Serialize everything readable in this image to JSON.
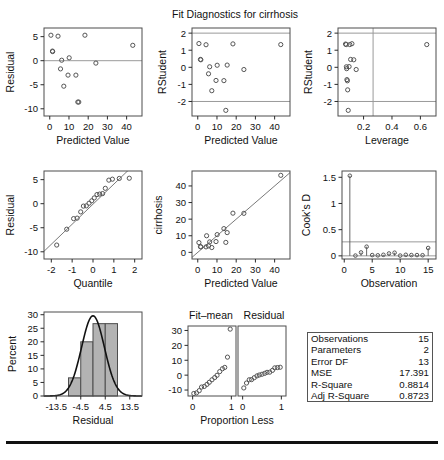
{
  "figure": {
    "title": "Fit Diagnostics for cirrhosis",
    "subtitle_fitmean": "Fit–mean",
    "subtitle_residual": "Residual"
  },
  "stats_table": {
    "rows": [
      {
        "label": "Observations",
        "value": "15"
      },
      {
        "label": "Parameters",
        "value": "2"
      },
      {
        "label": "Error DF",
        "value": "13"
      },
      {
        "label": "MSE",
        "value": "17.391"
      },
      {
        "label": "R-Square",
        "value": "0.8814"
      },
      {
        "label": "Adj R-Square",
        "value": "0.8723"
      }
    ]
  },
  "chart_data": [
    {
      "id": "residual-vs-predicted",
      "type": "scatter",
      "title": "",
      "xlabel": "Predicted Value",
      "ylabel": "Residual",
      "xlim": [
        -3,
        48
      ],
      "ylim": [
        -11.5,
        6.8
      ],
      "xticks": [
        0,
        10,
        20,
        30,
        40
      ],
      "yticks": [
        -10,
        -5,
        0,
        5
      ],
      "reflines_y": [
        0
      ],
      "grid": false,
      "x": [
        0.6,
        1.4,
        1.5,
        4.3,
        5.6,
        6.2,
        7.3,
        9.5,
        10.1,
        13.6,
        14.6,
        15.1,
        18.3,
        24.0,
        43.2
      ],
      "y": [
        5.3,
        2.0,
        1.9,
        5.1,
        -1.7,
        0.1,
        -5.3,
        -3.0,
        0.6,
        -3.0,
        -8.6,
        -8.6,
        5.3,
        -0.5,
        3.2
      ]
    },
    {
      "id": "rstudent-vs-predicted",
      "type": "scatter",
      "title": "",
      "xlabel": "Predicted Value",
      "ylabel": "RStudent",
      "xlim": [
        -3,
        48
      ],
      "ylim": [
        -2.85,
        2.3
      ],
      "xticks": [
        0,
        10,
        20,
        30,
        40
      ],
      "yticks": [
        -2,
        -1,
        0,
        1,
        2
      ],
      "reflines_y": [
        -2,
        2
      ],
      "grid": false,
      "x": [
        0.6,
        1.4,
        1.6,
        4.3,
        5.6,
        6.2,
        7.3,
        9.5,
        10.1,
        13.6,
        14.6,
        15.3,
        18.3,
        24.0,
        43.2
      ],
      "y": [
        1.39,
        0.46,
        0.44,
        1.32,
        -0.38,
        0.03,
        -1.37,
        -0.77,
        0.12,
        -0.78,
        -2.52,
        0.13,
        1.37,
        -0.13,
        1.33
      ]
    },
    {
      "id": "rstudent-vs-leverage",
      "type": "scatter",
      "title": "",
      "xlabel": "Leverage",
      "ylabel": "RStudent",
      "xlim": [
        0.02,
        0.71
      ],
      "ylim": [
        -2.85,
        2.3
      ],
      "xticks": [
        0.2,
        0.4,
        0.6
      ],
      "yticks": [
        -2,
        -1,
        0,
        1,
        2
      ],
      "reflines_y": [
        -2,
        2
      ],
      "reflines_x": [
        0.267
      ],
      "grid": false,
      "x": [
        0.073,
        0.078,
        0.079,
        0.081,
        0.083,
        0.086,
        0.088,
        0.092,
        0.098,
        0.103,
        0.109,
        0.118,
        0.131,
        0.148,
        0.645
      ],
      "y": [
        1.36,
        1.33,
        0.03,
        -0.08,
        -0.72,
        -0.79,
        -1.32,
        -2.52,
        0.04,
        1.33,
        0.46,
        1.38,
        0.44,
        -0.13,
        1.33
      ]
    },
    {
      "id": "qq-plot",
      "type": "scatter",
      "title": "",
      "xlabel": "Quantile",
      "ylabel": "Residual",
      "xlim": [
        -2.35,
        2.35
      ],
      "ylim": [
        -11.5,
        6.8
      ],
      "xticks": [
        -2,
        -1,
        0,
        1,
        2
      ],
      "yticks": [
        -10,
        -5,
        0,
        5
      ],
      "fitline": {
        "slope": 4.17,
        "intercept": -0.1
      },
      "grid": false,
      "x": [
        -1.74,
        -1.26,
        -0.93,
        -0.76,
        -0.59,
        -0.46,
        -0.32,
        -0.19,
        -0.06,
        0.06,
        0.19,
        0.32,
        0.46,
        0.59,
        0.76,
        0.93,
        1.26,
        1.74
      ],
      "y": [
        -8.6,
        -5.3,
        -3.1,
        -3.0,
        -1.7,
        -0.5,
        -0.45,
        0.1,
        0.6,
        1.2,
        1.9,
        2.0,
        2.1,
        3.2,
        4.9,
        5.1,
        5.25,
        5.3
      ]
    },
    {
      "id": "observed-vs-predicted",
      "type": "scatter",
      "title": "",
      "xlabel": "Predicted Value",
      "ylabel": "cirrhosis",
      "xlim": [
        -3,
        48
      ],
      "ylim": [
        -4,
        49
      ],
      "xticks": [
        0,
        10,
        20,
        30,
        40
      ],
      "yticks": [
        0,
        10,
        20,
        30,
        40
      ],
      "fitline": {
        "slope": 1,
        "intercept": 0
      },
      "grid": false,
      "x": [
        0.6,
        1.4,
        1.6,
        4.3,
        4.6,
        5.6,
        6.2,
        7.3,
        9.5,
        10.1,
        13.6,
        14.6,
        15.3,
        18.3,
        24.0,
        43.2
      ],
      "y": [
        5.9,
        3.4,
        3.3,
        3.3,
        10.0,
        3.9,
        6.3,
        2.9,
        6.5,
        10.7,
        14.3,
        6.0,
        11.9,
        23.6,
        23.5,
        46.4
      ]
    },
    {
      "id": "cooks-d",
      "type": "needle",
      "title": "",
      "xlabel": "Observation",
      "ylabel": "Cook's D",
      "xlim": [
        -0.4,
        16.4
      ],
      "ylim": [
        -0.06,
        1.62
      ],
      "xticks": [
        0,
        5,
        10,
        15
      ],
      "yticks": [
        0.0,
        0.5,
        1.0,
        1.5
      ],
      "reflines_y": [
        0.267
      ],
      "grid": false,
      "x": [
        1,
        2,
        3,
        4,
        5,
        6,
        7,
        8,
        9,
        10,
        11,
        12,
        13,
        14,
        15
      ],
      "y": [
        1.53,
        0.005,
        0.065,
        0.175,
        0.015,
        0.01,
        0.02,
        0.045,
        0.06,
        0.005,
        0.02,
        0.015,
        0.015,
        0.012,
        0.15
      ]
    },
    {
      "id": "residual-histogram",
      "type": "bar",
      "title": "",
      "xlabel": "Residual",
      "ylabel": "Percent",
      "xlim": [
        -18,
        18
      ],
      "ylim": [
        0,
        31
      ],
      "xticks": [
        -13.5,
        -4.5,
        4.5,
        13.5
      ],
      "yticks": [
        0,
        5,
        10,
        15,
        20,
        25,
        30
      ],
      "bin_edges": [
        -9,
        -4.5,
        0,
        4.5,
        9
      ],
      "values": [
        6.7,
        20.0,
        26.7,
        26.7
      ],
      "normal_curve": {
        "mean": 0.0,
        "sd": 4.2,
        "peak_percent": 29.6
      },
      "grid": false
    },
    {
      "id": "fitmean-panel",
      "type": "scatter",
      "title": "Fit–mean",
      "xlabel": "Proportion Less",
      "ylabel": "",
      "xlim": [
        -0.12,
        1.12
      ],
      "ylim": [
        -14,
        33
      ],
      "xticks": [
        0,
        1
      ],
      "yticks": [
        -10,
        0,
        10,
        20,
        30
      ],
      "grid": false,
      "x": [
        0.03,
        0.1,
        0.17,
        0.23,
        0.3,
        0.37,
        0.43,
        0.5,
        0.57,
        0.63,
        0.7,
        0.77,
        0.83,
        0.9,
        0.97
      ],
      "y": [
        -12.3,
        -11.9,
        -10.4,
        -8.0,
        -7.6,
        -6.2,
        -4.8,
        -3.1,
        -1.6,
        -0.1,
        2.4,
        4.3,
        5.2,
        12.1,
        30.9
      ]
    },
    {
      "id": "residual-panel",
      "type": "scatter",
      "title": "Residual",
      "xlabel": "Proportion Less",
      "ylabel": "",
      "xlim": [
        -0.12,
        1.12
      ],
      "ylim": [
        -14,
        33
      ],
      "xticks": [
        0,
        1
      ],
      "yticks": [],
      "grid": false,
      "x": [
        0.03,
        0.1,
        0.17,
        0.23,
        0.3,
        0.37,
        0.43,
        0.5,
        0.57,
        0.63,
        0.7,
        0.77,
        0.83,
        0.9,
        0.97
      ],
      "y": [
        -8.6,
        -5.3,
        -3.1,
        -3.0,
        -1.7,
        -0.5,
        0.1,
        0.6,
        1.2,
        1.9,
        2.0,
        3.2,
        4.9,
        5.1,
        5.3
      ]
    }
  ]
}
